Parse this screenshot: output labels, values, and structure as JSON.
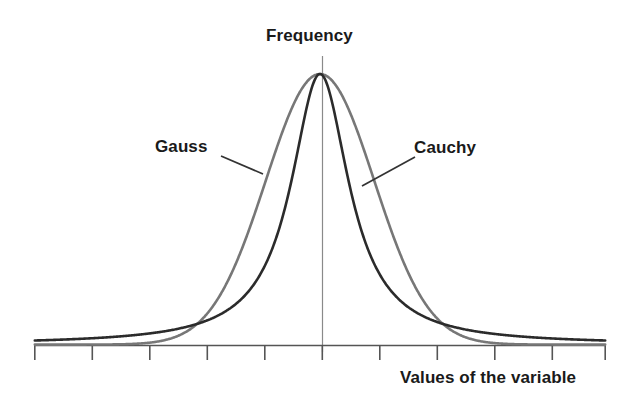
{
  "figure": {
    "background_color": "#ffffff",
    "axis_title_y": "Frequency",
    "axis_title_x": "Values of the variable"
  },
  "annotations": {
    "gauss_label": "Gauss",
    "cauchy_label": "Cauchy"
  },
  "colors": {
    "gauss_curve": "#777777",
    "cauchy_curve": "#2b2b2b",
    "axis": "#555555",
    "center_line": "#8a8a8a",
    "text": "#1a1a1a",
    "leader_line": "#333333"
  },
  "chart_data": {
    "type": "line",
    "title": "",
    "xlabel": "Values of the variable",
    "ylabel": "Frequency",
    "xlim": [
      -5,
      5
    ],
    "ylim": [
      0,
      1
    ],
    "grid": false,
    "legend": "inline-annotations",
    "x_axis": {
      "tick_labels": [
        "",
        "",
        "",
        "",
        "",
        "",
        "",
        "",
        "",
        "",
        ""
      ],
      "tick_positions": [
        -5,
        -4,
        -3,
        -2,
        -1,
        0,
        1,
        2,
        3,
        4,
        5
      ],
      "tick_count": 11,
      "tick_direction": "outward-down",
      "shows_values": false
    },
    "y_axis": {
      "tick_labels": [],
      "shows_values": false,
      "rendered_as": "vertical center line at x=0"
    },
    "curve_crossings_x": [
      -1.85,
      1.85
    ],
    "series": [
      {
        "name": "Gauss",
        "color": "#777777",
        "formula": "exp(-x^2 / (2*0.95^2))",
        "peak_value": 1.0,
        "peak_x": 0,
        "x": [
          -5.0,
          -4.5,
          -4.0,
          -3.5,
          -3.0,
          -2.75,
          -2.5,
          -2.25,
          -2.0,
          -1.85,
          -1.75,
          -1.5,
          -1.25,
          -1.0,
          -0.75,
          -0.5,
          -0.25,
          0.0,
          0.25,
          0.5,
          0.75,
          1.0,
          1.25,
          1.5,
          1.75,
          1.85,
          2.0,
          2.25,
          2.5,
          2.75,
          3.0,
          3.5,
          4.0,
          4.5,
          5.0
        ],
        "values": [
          0.0,
          0.0,
          0.0,
          0.001,
          0.007,
          0.016,
          0.031,
          0.057,
          0.105,
          0.137,
          0.165,
          0.246,
          0.338,
          0.443,
          0.554,
          0.661,
          0.76,
          1.0,
          0.76,
          0.661,
          0.554,
          0.443,
          0.338,
          0.246,
          0.165,
          0.137,
          0.105,
          0.057,
          0.031,
          0.016,
          0.007,
          0.001,
          0.0,
          0.0,
          0.0
        ]
      },
      {
        "name": "Cauchy",
        "color": "#2b2b2b",
        "formula": "1 / (1 + (x/0.62)^2)",
        "peak_value": 1.0,
        "peak_x": 0,
        "x": [
          -5.0,
          -4.5,
          -4.0,
          -3.5,
          -3.0,
          -2.75,
          -2.5,
          -2.25,
          -2.0,
          -1.85,
          -1.75,
          -1.5,
          -1.25,
          -1.0,
          -0.75,
          -0.5,
          -0.25,
          0.0,
          0.25,
          0.5,
          0.75,
          1.0,
          1.25,
          1.5,
          1.75,
          1.85,
          2.0,
          2.25,
          2.5,
          2.75,
          3.0,
          3.5,
          4.0,
          4.5,
          5.0
        ],
        "values": [
          0.015,
          0.019,
          0.023,
          0.03,
          0.041,
          0.048,
          0.058,
          0.071,
          0.088,
          0.101,
          0.111,
          0.146,
          0.197,
          0.278,
          0.406,
          0.606,
          0.86,
          1.0,
          0.86,
          0.606,
          0.406,
          0.278,
          0.197,
          0.146,
          0.111,
          0.101,
          0.088,
          0.071,
          0.058,
          0.048,
          0.041,
          0.03,
          0.023,
          0.019,
          0.015
        ]
      }
    ],
    "annotations": [
      {
        "text": "Gauss",
        "points_to": "Gauss curve, left flank"
      },
      {
        "text": "Cauchy",
        "points_to": "Cauchy curve, right flank"
      }
    ]
  }
}
